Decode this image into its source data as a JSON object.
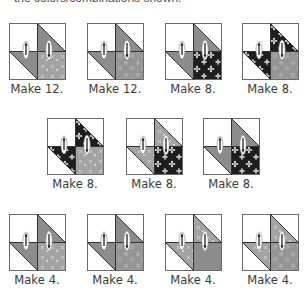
{
  "header": {
    "cropped_text": "the colors/combinations shown."
  },
  "colors": {
    "outline": "#333333",
    "light_gray": "#9a9a9a",
    "mid_gray": "#8c8c8c",
    "dark_floral": "#1e1e1e",
    "floral_petal": "#dedede",
    "white": "#ffffff"
  },
  "rows": [
    {
      "y": 23,
      "blocks": [
        {
          "x": 9,
          "label": "Make 12.",
          "tr": "gray",
          "bl": "gray",
          "br": "lightfloral"
        },
        {
          "x": 87,
          "label": "Make 12.",
          "tr": "gray",
          "bl": "gray",
          "br": "mottled"
        },
        {
          "x": 165,
          "label": "Make 8.",
          "tr": "gray",
          "bl": "gray",
          "br": "darkfloral"
        },
        {
          "x": 242,
          "label": "Make 8.",
          "tr": "darkfloral",
          "bl": "darkfloral",
          "br": "mottled"
        }
      ]
    },
    {
      "y": 118,
      "blocks": [
        {
          "x": 47,
          "label": "Make 8.",
          "tr": "darkfloral",
          "bl": "darkfloral",
          "br": "lightfloral"
        },
        {
          "x": 126,
          "label": "Make 8.",
          "tr": "lightfloral",
          "bl": "lightfloral",
          "br": "darkfloral"
        },
        {
          "x": 203,
          "label": "Make 8.",
          "tr": "gray",
          "bl": "gray",
          "br": "darkfloral"
        }
      ]
    },
    {
      "y": 214,
      "blocks": [
        {
          "x": 9,
          "label": "Make 4.",
          "tr": "gray",
          "bl": "gray",
          "br": "lightfloral"
        },
        {
          "x": 87,
          "label": "Make 4.",
          "tr": "gray",
          "bl": "gray",
          "br": "mottled"
        },
        {
          "x": 165,
          "label": "Make 4.",
          "tr": "lightfloral",
          "bl": "lightfloral",
          "br": "gray"
        },
        {
          "x": 242,
          "label": "Make 4.",
          "tr": "lightfloral",
          "bl": "lightfloral",
          "br": "mottled"
        }
      ]
    }
  ]
}
